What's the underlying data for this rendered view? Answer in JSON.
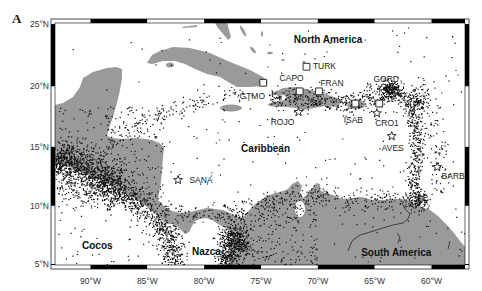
{
  "figure": {
    "panel_label": "A"
  },
  "map": {
    "projection": "Mercator",
    "extent": {
      "lon_min": -93.4,
      "lon_max": -56.8,
      "lat_min": 4.7,
      "lat_max": 25.1
    },
    "lat_ticks": [
      {
        "value": 25,
        "label": "25°N"
      },
      {
        "value": 20,
        "label": "20°N"
      },
      {
        "value": 15,
        "label": "15°N"
      },
      {
        "value": 10,
        "label": "10°N"
      },
      {
        "value": 5,
        "label": "5°N"
      }
    ],
    "lon_ticks": [
      {
        "value": -90,
        "label": "90°W"
      },
      {
        "value": -85,
        "label": "85°W"
      },
      {
        "value": -80,
        "label": "80°W"
      },
      {
        "value": -75,
        "label": "75°W"
      },
      {
        "value": -70,
        "label": "70°W"
      },
      {
        "value": -65,
        "label": "65°W"
      },
      {
        "value": -60,
        "label": "60°W"
      }
    ],
    "colors": {
      "land": "#9a9a9a",
      "water": "#ffffff",
      "seismicity": "#111111",
      "frame": "#000000"
    },
    "region_labels": [
      {
        "name": "North America",
        "lon": -69.1,
        "lat": 23.8
      },
      {
        "name": "Caribbean",
        "lon": -74.6,
        "lat": 14.9
      },
      {
        "name": "Cocos",
        "lon": -89.4,
        "lat": 6.6
      },
      {
        "name": "Nazca",
        "lon": -79.8,
        "lat": 6.1
      },
      {
        "name": "South America",
        "lon": -63.1,
        "lat": 6.0
      }
    ],
    "stations": [
      {
        "code": "TURK",
        "marker": "square",
        "lon": -71.0,
        "lat": 21.6,
        "label_dx": 18,
        "label_dy": -1
      },
      {
        "code": "GTMO",
        "marker": "square",
        "lon": -74.8,
        "lat": 20.3,
        "label_dx": -11,
        "label_dy": 13
      },
      {
        "code": "CAPO",
        "marker": "square",
        "lon": -71.6,
        "lat": 19.6,
        "label_dx": -8,
        "label_dy": -13
      },
      {
        "code": "FRAN",
        "marker": "square",
        "lon": -69.9,
        "lat": 19.6,
        "label_dx": 13,
        "label_dy": -8
      },
      {
        "code": "GORD",
        "marker": "square",
        "lon": -64.6,
        "lat": 18.6,
        "label_dx": 7,
        "label_dy": -25
      },
      {
        "code": "ISAB",
        "marker": "square",
        "lon": -66.7,
        "lat": 18.6,
        "label_dx": -2,
        "label_dy": 16
      },
      {
        "code": "ROJO",
        "marker": "star",
        "lon": -71.7,
        "lat": 17.9,
        "label_dx": -16,
        "label_dy": 10
      },
      {
        "code": "CRO1",
        "marker": "star",
        "lon": -64.8,
        "lat": 17.8,
        "label_dx": 10,
        "label_dy": 10
      },
      {
        "code": "AVES",
        "marker": "star",
        "lon": -63.5,
        "lat": 15.9,
        "label_dx": 1,
        "label_dy": 12
      },
      {
        "code": "BARB",
        "marker": "star",
        "lon": -59.5,
        "lat": 13.3,
        "label_dx": 16,
        "label_dy": 9
      },
      {
        "code": "SANA",
        "marker": "star",
        "lon": -82.3,
        "lat": 12.2,
        "label_dx": 23,
        "label_dy": 0
      }
    ],
    "seismicity": {
      "marker": "dot",
      "clusters": [
        {
          "type": "line",
          "path": [
            [
              55,
              157
            ],
            [
              75,
              166
            ],
            [
              95,
              176
            ],
            [
              115,
              188
            ],
            [
              135,
              200
            ],
            [
              150,
              212
            ],
            [
              163,
              226
            ],
            [
              171,
              242
            ],
            [
              176,
              266
            ]
          ],
          "spread": 7,
          "count": 1100
        },
        {
          "type": "line",
          "path": [
            [
              55,
              165
            ],
            [
              80,
              175
            ],
            [
              100,
              185
            ],
            [
              120,
              196
            ]
          ],
          "spread": 12,
          "count": 500
        },
        {
          "type": "line",
          "path": [
            [
              55,
              150
            ],
            [
              90,
              162
            ],
            [
              120,
              176
            ]
          ],
          "spread": 10,
          "count": 250
        },
        {
          "type": "blob",
          "center": [
            233,
            240
          ],
          "spread": 8,
          "count": 420
        },
        {
          "type": "blob",
          "center": [
            226,
            258
          ],
          "spread": 5,
          "count": 150
        },
        {
          "type": "line",
          "path": [
            [
              175,
              214
            ],
            [
              200,
              212
            ],
            [
              225,
              213
            ],
            [
              245,
              219
            ]
          ],
          "spread": 4,
          "count": 110
        },
        {
          "type": "box",
          "rect": [
            58,
            105,
            105,
            95
          ],
          "count": 260
        },
        {
          "type": "line",
          "path": [
            [
              108,
              142
            ],
            [
              125,
              130
            ],
            [
              150,
              118
            ],
            [
              185,
              106
            ],
            [
              215,
              98
            ],
            [
              250,
              92
            ]
          ],
          "spread": 5,
          "count": 140
        },
        {
          "type": "line",
          "path": [
            [
              268,
              100
            ],
            [
              290,
              97
            ],
            [
              315,
              98
            ],
            [
              340,
              104
            ],
            [
              360,
              100
            ],
            [
              380,
              95
            ],
            [
              398,
              91
            ]
          ],
          "spread": 6,
          "count": 420
        },
        {
          "type": "blob",
          "center": [
            390,
            90
          ],
          "spread": 5,
          "count": 220
        },
        {
          "type": "line",
          "path": [
            [
              398,
              92
            ],
            [
              406,
              100
            ],
            [
              412,
              115
            ],
            [
              416,
              130
            ],
            [
              418,
              145
            ],
            [
              416,
              160
            ],
            [
              414,
              175
            ],
            [
              413,
              190
            ],
            [
              418,
              205
            ]
          ],
          "spread": 3.5,
          "count": 380
        },
        {
          "type": "line",
          "path": [
            [
              425,
              108
            ],
            [
              435,
              128
            ],
            [
              442,
              150
            ],
            [
              445,
              170
            ],
            [
              440,
              192
            ]
          ],
          "spread": 7,
          "count": 90
        },
        {
          "type": "blob",
          "center": [
            418,
            100
          ],
          "spread": 6,
          "count": 120
        },
        {
          "type": "line",
          "path": [
            [
              255,
              204
            ],
            [
              290,
              197
            ],
            [
              320,
              196
            ],
            [
              350,
              200
            ],
            [
              380,
              200
            ],
            [
              410,
              198
            ],
            [
              428,
              206
            ]
          ],
          "spread": 5,
          "count": 280
        },
        {
          "type": "box",
          "rect": [
            232,
            200,
            85,
            65
          ],
          "count": 260
        },
        {
          "type": "blob",
          "center": [
            420,
            199
          ],
          "spread": 5,
          "count": 80
        },
        {
          "type": "box",
          "rect": [
            120,
            100,
            300,
            110
          ],
          "count": 110
        },
        {
          "type": "box",
          "rect": [
            58,
            198,
            115,
            66
          ],
          "count": 60
        },
        {
          "type": "box",
          "rect": [
            58,
            26,
            405,
            70
          ],
          "count": 35
        },
        {
          "type": "box",
          "rect": [
            395,
            26,
            68,
            80
          ],
          "count": 30
        },
        {
          "type": "box",
          "rect": [
            330,
            205,
            135,
            60
          ],
          "count": 40
        }
      ]
    }
  }
}
